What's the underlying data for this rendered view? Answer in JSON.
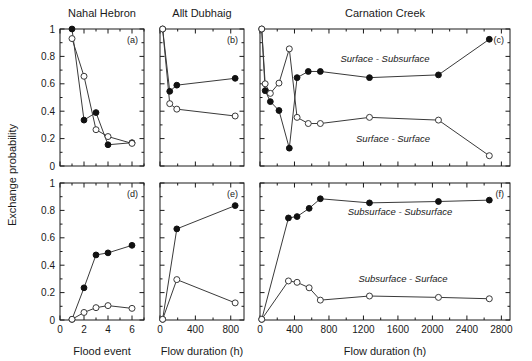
{
  "figure": {
    "y_axis_label": "Exchange probability",
    "column_titles": [
      "Nahal Hebron",
      "Allt Dubhaig",
      "Carnation Creek"
    ],
    "x_axis_labels": [
      "Flood event",
      "Flow duration (h)",
      "Flow duration (h)"
    ],
    "panel_letters": [
      "(a)",
      "(b)",
      "(c)",
      "(d)",
      "(e)",
      "(f)"
    ],
    "y_ticks": [
      "0",
      "0.2",
      "0.4",
      "0.6",
      "0.8",
      "1"
    ],
    "y_tick_values": [
      0,
      0.2,
      0.4,
      0.6,
      0.8,
      1
    ],
    "ylim": [
      0,
      1
    ],
    "annotations": {
      "surface_subsurface": "Surface - Subsurface",
      "surface_surface": "Surface - Surface",
      "subsurface_subsurface": "Subsurface - Subsurface",
      "subsurface_surface": "Subsurface - Surface"
    }
  },
  "chart_data": [
    {
      "id": "panel-a",
      "type": "line",
      "title": "Nahal Hebron",
      "panel_letter": "(a)",
      "xlabel": "Flood event",
      "ylabel": "Exchange probability",
      "xlim": [
        0,
        7
      ],
      "ylim": [
        0,
        1
      ],
      "x_ticks": [
        0,
        2,
        4,
        6
      ],
      "x_tick_labels": [
        "0",
        "2",
        "4",
        "6"
      ],
      "x_minor_ticks": [
        1,
        3,
        5,
        7
      ],
      "y_ticks": [
        0,
        0.2,
        0.4,
        0.6,
        0.8,
        1
      ],
      "y_minor_ticks": [
        0.1,
        0.3,
        0.5,
        0.7,
        0.9
      ],
      "grid": false,
      "legend": "none",
      "series": [
        {
          "name": "Surface - Subsurface",
          "marker": "filled",
          "x": [
            1,
            2,
            3,
            4,
            6
          ],
          "values": [
            1.0,
            0.335,
            0.39,
            0.155,
            0.17
          ]
        },
        {
          "name": "Surface - Surface",
          "marker": "open",
          "x": [
            1,
            2,
            3,
            4,
            6
          ],
          "values": [
            0.93,
            0.655,
            0.265,
            0.215,
            0.165
          ]
        }
      ]
    },
    {
      "id": "panel-b",
      "type": "line",
      "title": "Allt Dubhaig",
      "panel_letter": "(b)",
      "xlabel": "Flow duration (h)",
      "ylabel": "Exchange probability",
      "xlim": [
        0,
        950
      ],
      "ylim": [
        0,
        1
      ],
      "x_ticks": [
        0,
        400,
        800
      ],
      "x_tick_labels": [
        "0",
        "400",
        "800"
      ],
      "x_minor_ticks": [
        200,
        600
      ],
      "y_ticks": [
        0,
        0.2,
        0.4,
        0.6,
        0.8,
        1
      ],
      "y_minor_ticks": [
        0.1,
        0.3,
        0.5,
        0.7,
        0.9
      ],
      "grid": false,
      "legend": "none",
      "series": [
        {
          "name": "Surface - Subsurface",
          "marker": "filled",
          "x": [
            30,
            110,
            190,
            850
          ],
          "values": [
            1.0,
            0.545,
            0.59,
            0.64
          ]
        },
        {
          "name": "Surface - Surface",
          "marker": "open",
          "x": [
            30,
            110,
            190,
            850
          ],
          "values": [
            1.0,
            0.455,
            0.415,
            0.365
          ]
        }
      ]
    },
    {
      "id": "panel-c",
      "type": "line",
      "title": "Carnation Creek",
      "panel_letter": "(c)",
      "xlabel": "Flow duration (h)",
      "ylabel": "Exchange probability",
      "xlim": [
        0,
        2900
      ],
      "ylim": [
        0,
        1
      ],
      "x_ticks": [
        0,
        400,
        800,
        1200,
        1600,
        2000,
        2400,
        2800
      ],
      "x_tick_labels": [
        "0",
        "400",
        "800",
        "1200",
        "1600",
        "2000",
        "2400",
        "2800"
      ],
      "x_minor_ticks": [
        200,
        600,
        1000,
        1400,
        1800,
        2200,
        2600
      ],
      "y_ticks": [
        0,
        0.2,
        0.4,
        0.6,
        0.8,
        1
      ],
      "y_minor_ticks": [
        0.1,
        0.3,
        0.5,
        0.7,
        0.9
      ],
      "grid": false,
      "legend": "inline",
      "series": [
        {
          "name": "Surface - Subsurface",
          "marker": "filled",
          "annotation": "Surface - Subsurface",
          "x": [
            20,
            60,
            120,
            220,
            340,
            430,
            560,
            700,
            1270,
            2070,
            2660
          ],
          "values": [
            1.0,
            0.55,
            0.47,
            0.405,
            0.13,
            0.645,
            0.69,
            0.69,
            0.645,
            0.665,
            0.925
          ]
        },
        {
          "name": "Surface - Surface",
          "marker": "open",
          "annotation": "Surface - Surface",
          "x": [
            20,
            60,
            120,
            220,
            340,
            430,
            560,
            700,
            1270,
            2070,
            2660
          ],
          "values": [
            1.0,
            0.6,
            0.53,
            0.605,
            0.855,
            0.355,
            0.31,
            0.31,
            0.355,
            0.335,
            0.075
          ]
        }
      ]
    },
    {
      "id": "panel-d",
      "type": "line",
      "title": "Nahal Hebron",
      "panel_letter": "(d)",
      "xlabel": "Flood event",
      "ylabel": "Exchange probability",
      "xlim": [
        0,
        7
      ],
      "ylim": [
        0,
        1
      ],
      "x_ticks": [
        0,
        2,
        4,
        6
      ],
      "x_tick_labels": [
        "0",
        "2",
        "4",
        "6"
      ],
      "x_minor_ticks": [
        1,
        3,
        5,
        7
      ],
      "y_ticks": [
        0,
        0.2,
        0.4,
        0.6,
        0.8,
        1
      ],
      "y_minor_ticks": [
        0.1,
        0.3,
        0.5,
        0.7,
        0.9
      ],
      "grid": false,
      "legend": "none",
      "series": [
        {
          "name": "Subsurface - Subsurface",
          "marker": "filled",
          "x": [
            1,
            2,
            3,
            4,
            6
          ],
          "values": [
            0.005,
            0.235,
            0.475,
            0.49,
            0.545
          ]
        },
        {
          "name": "Subsurface - Surface",
          "marker": "open",
          "x": [
            1,
            2,
            3,
            4,
            6
          ],
          "values": [
            0.005,
            0.055,
            0.09,
            0.105,
            0.085
          ]
        }
      ]
    },
    {
      "id": "panel-e",
      "type": "line",
      "title": "Allt Dubhaig",
      "panel_letter": "(e)",
      "xlabel": "Flow duration (h)",
      "ylabel": "Exchange probability",
      "xlim": [
        0,
        950
      ],
      "ylim": [
        0,
        1
      ],
      "x_ticks": [
        0,
        400,
        800
      ],
      "x_tick_labels": [
        "0",
        "400",
        "800"
      ],
      "x_minor_ticks": [
        200,
        600
      ],
      "y_ticks": [
        0,
        0.2,
        0.4,
        0.6,
        0.8,
        1
      ],
      "y_minor_ticks": [
        0.1,
        0.3,
        0.5,
        0.7,
        0.9
      ],
      "grid": false,
      "legend": "none",
      "series": [
        {
          "name": "Subsurface - Subsurface",
          "marker": "filled",
          "x": [
            30,
            190,
            850
          ],
          "values": [
            0.005,
            0.665,
            0.835
          ]
        },
        {
          "name": "Subsurface - Surface",
          "marker": "open",
          "x": [
            30,
            190,
            850
          ],
          "values": [
            0.005,
            0.295,
            0.125
          ]
        }
      ]
    },
    {
      "id": "panel-f",
      "type": "line",
      "title": "Carnation Creek",
      "panel_letter": "(f)",
      "xlabel": "Flow duration (h)",
      "ylabel": "Exchange probability",
      "xlim": [
        0,
        2900
      ],
      "ylim": [
        0,
        1
      ],
      "x_ticks": [
        0,
        400,
        800,
        1200,
        1600,
        2000,
        2400,
        2800
      ],
      "x_tick_labels": [
        "0",
        "400",
        "800",
        "1200",
        "1600",
        "2000",
        "2400",
        "2800"
      ],
      "x_minor_ticks": [
        200,
        600,
        1000,
        1400,
        1800,
        2200,
        2600
      ],
      "y_ticks": [
        0,
        0.2,
        0.4,
        0.6,
        0.8,
        1
      ],
      "y_minor_ticks": [
        0.1,
        0.3,
        0.5,
        0.7,
        0.9
      ],
      "grid": false,
      "legend": "inline",
      "series": [
        {
          "name": "Subsurface - Subsurface",
          "marker": "filled",
          "annotation": "Subsurface - Subsurface",
          "x": [
            20,
            330,
            430,
            570,
            700,
            1270,
            2070,
            2660
          ],
          "values": [
            0.005,
            0.745,
            0.755,
            0.815,
            0.885,
            0.855,
            0.865,
            0.875
          ]
        },
        {
          "name": "Subsurface - Surface",
          "marker": "open",
          "annotation": "Subsurface - Surface",
          "x": [
            20,
            330,
            430,
            570,
            700,
            1270,
            2070,
            2660
          ],
          "values": [
            0.005,
            0.285,
            0.275,
            0.235,
            0.145,
            0.175,
            0.165,
            0.155
          ]
        }
      ]
    }
  ]
}
